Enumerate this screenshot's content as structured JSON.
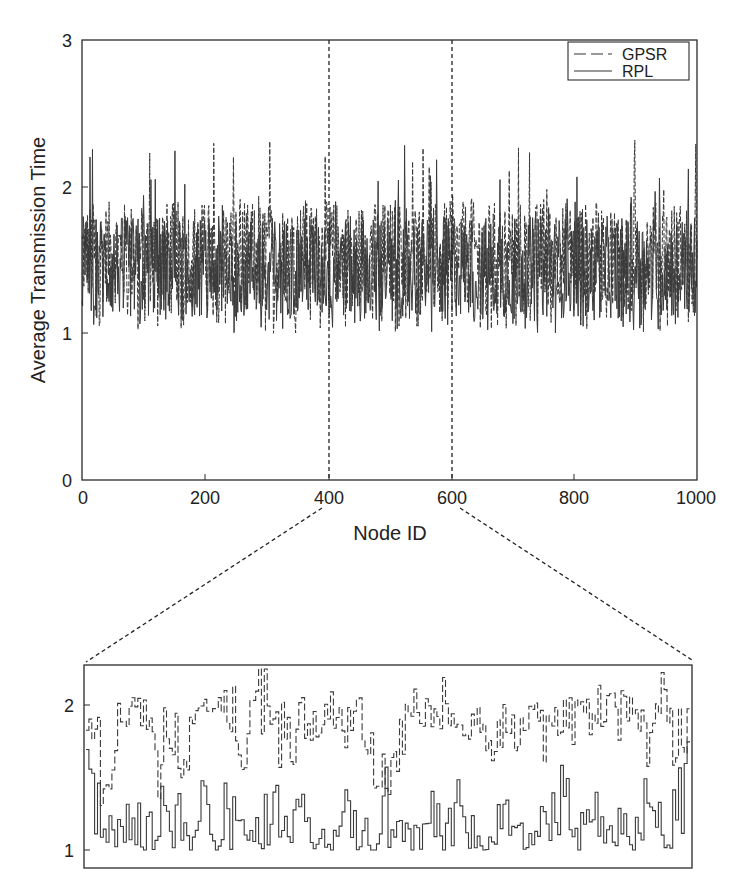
{
  "chart_data": [
    {
      "type": "line",
      "role": "main",
      "title": "",
      "xlabel": "Node ID",
      "ylabel": "Average Transmission Time",
      "xlim": [
        0,
        1000
      ],
      "ylim": [
        0,
        3
      ],
      "xticks": [
        "0",
        "200",
        "400",
        "600",
        "800",
        "1000"
      ],
      "yticks": [
        "0",
        "1",
        "2",
        "3"
      ],
      "grid": false,
      "legend": {
        "position": "upper right",
        "entries": [
          "GPSR",
          "RPL"
        ]
      },
      "series": [
        {
          "name": "GPSR",
          "style": "dashed",
          "range": [
            1.0,
            2.35
          ],
          "typical": [
            1.2,
            1.9
          ],
          "n_points": 1000
        },
        {
          "name": "RPL",
          "style": "solid",
          "range": [
            1.0,
            2.3
          ],
          "typical": [
            1.1,
            1.8
          ],
          "n_points": 1000
        }
      ],
      "annotations": [
        {
          "type": "vline",
          "x": 400,
          "style": "dashed"
        },
        {
          "type": "vline",
          "x": 600,
          "style": "dashed"
        }
      ]
    },
    {
      "type": "line",
      "role": "zoom-inset",
      "title": "",
      "xlabel": "",
      "ylabel": "",
      "xlim": [
        400,
        600
      ],
      "ylim": [
        0.87,
        2.27
      ],
      "yticks": [
        "1",
        "2"
      ],
      "grid": false,
      "series": [
        {
          "name": "GPSR",
          "style": "dashed-step",
          "sample_values": [
            1.85,
            1.3,
            1.65,
            1.95,
            2.05,
            1.4,
            1.8,
            1.55,
            2.03,
            1.95,
            2.1,
            1.6,
            2.25,
            1.85,
            1.55,
            1.9,
            1.7,
            1.95,
            1.75,
            1.98,
            1.6,
            1.5,
            1.8,
            2.02,
            1.95,
            2.05,
            1.75,
            2.0,
            1.65,
            1.85,
            1.7,
            1.95,
            1.7,
            1.85,
            1.8,
            1.95,
            2.15,
            1.9,
            2.1,
            1.75,
            2.2,
            1.6
          ]
        },
        {
          "name": "RPL",
          "style": "solid-step",
          "sample_values": [
            1.8,
            1.25,
            1.1,
            1.3,
            1.05,
            1.25,
            1.5,
            1.0,
            1.35,
            1.05,
            1.45,
            1.0,
            1.1,
            1.4,
            1.05,
            1.3,
            1.1,
            1.0,
            1.35,
            1.1,
            1.05,
            1.5,
            1.15,
            1.0,
            1.3,
            1.05,
            1.4,
            1.1,
            1.05,
            1.45,
            1.1,
            1.25,
            1.05,
            1.5,
            1.1,
            1.35,
            1.05,
            1.2,
            1.1,
            1.4,
            1.1,
            1.3
          ]
        }
      ]
    }
  ],
  "labels": {
    "xlabel": "Node ID",
    "ylabel": "Average Transmission Time",
    "legend_gpsr": "GPSR",
    "legend_rpl": "RPL",
    "xticks": [
      "0",
      "200",
      "400",
      "600",
      "800",
      "1000"
    ],
    "yticks": [
      "0",
      "1",
      "2",
      "3"
    ],
    "inset_yticks": [
      "1",
      "2"
    ]
  },
  "colors": {
    "line": "#3a3a3a",
    "axis": "#2a2a2a",
    "background": "#ffffff"
  }
}
